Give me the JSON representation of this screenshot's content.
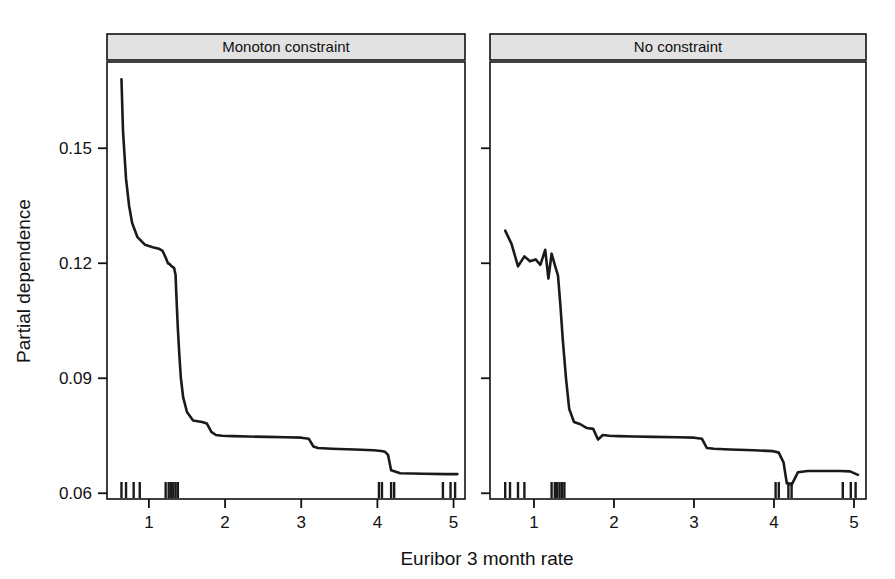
{
  "figure": {
    "xlabel": "Euribor 3 month rate",
    "ylabel": "Partial dependence",
    "line_color": "#1a1a1a",
    "strip_fill": "#e2e2e2",
    "strip_border": "#111111",
    "panel_border": "#111111"
  },
  "panels": [
    {
      "id": "monoton",
      "strip_label": "Monoton constraint"
    },
    {
      "id": "noconstraint",
      "strip_label": "No constraint"
    }
  ],
  "axes": {
    "x_ticks": [
      "1",
      "2",
      "3",
      "4",
      "5"
    ],
    "x_tick_values": [
      1,
      2,
      3,
      4,
      5
    ],
    "y_ticks": [
      "0.06",
      "0.09",
      "0.12",
      "0.15"
    ],
    "y_tick_values": [
      0.06,
      0.09,
      0.12,
      0.15
    ],
    "xlim": [
      0.45,
      5.15
    ],
    "ylim": [
      0.0585,
      0.1725
    ]
  },
  "chart_data": {
    "type": "line",
    "title": "",
    "xlabel": "Euribor 3 month rate",
    "ylabel": "Partial dependence",
    "xlim": [
      0.45,
      5.15
    ],
    "ylim": [
      0.0585,
      0.1725
    ],
    "grid": false,
    "legend": "none",
    "facets": [
      "Monoton constraint",
      "No constraint"
    ],
    "series": [
      {
        "name": "Monoton constraint",
        "facet": "Monoton constraint",
        "x": [
          0.64,
          0.66,
          0.7,
          0.74,
          0.78,
          0.85,
          0.95,
          1.05,
          1.13,
          1.18,
          1.22,
          1.25,
          1.27,
          1.3,
          1.33,
          1.35,
          1.36,
          1.38,
          1.4,
          1.42,
          1.45,
          1.5,
          1.58,
          1.64,
          1.7,
          1.76,
          1.82,
          1.88,
          1.96,
          2.1,
          2.3,
          2.55,
          2.8,
          3.0,
          3.1,
          3.16,
          3.22,
          3.4,
          3.7,
          3.95,
          4.05,
          4.1,
          4.14,
          4.18,
          4.3,
          4.6,
          4.9,
          5.05
        ],
        "y": [
          0.168,
          0.1545,
          0.142,
          0.135,
          0.1305,
          0.1268,
          0.1248,
          0.1242,
          0.1238,
          0.1232,
          0.1215,
          0.12,
          0.1198,
          0.1192,
          0.1188,
          0.117,
          0.112,
          0.103,
          0.096,
          0.09,
          0.085,
          0.0812,
          0.079,
          0.0788,
          0.0786,
          0.0782,
          0.076,
          0.0752,
          0.075,
          0.0749,
          0.0748,
          0.0747,
          0.0746,
          0.0745,
          0.0742,
          0.0722,
          0.0718,
          0.0716,
          0.0714,
          0.0712,
          0.071,
          0.0708,
          0.07,
          0.066,
          0.0652,
          0.0651,
          0.065,
          0.065
        ]
      },
      {
        "name": "No constraint",
        "facet": "No constraint",
        "x": [
          0.64,
          0.72,
          0.8,
          0.88,
          0.95,
          1.02,
          1.08,
          1.14,
          1.18,
          1.22,
          1.26,
          1.3,
          1.33,
          1.36,
          1.4,
          1.44,
          1.5,
          1.58,
          1.66,
          1.74,
          1.8,
          1.86,
          1.94,
          2.05,
          2.25,
          2.5,
          2.8,
          3.0,
          3.1,
          3.16,
          3.25,
          3.45,
          3.75,
          3.98,
          4.06,
          4.12,
          4.16,
          4.22,
          4.3,
          4.42,
          4.6,
          4.82,
          4.95,
          5.05
        ],
        "y": [
          0.1285,
          0.125,
          0.1192,
          0.1218,
          0.1205,
          0.121,
          0.1196,
          0.1235,
          0.116,
          0.1225,
          0.1196,
          0.1168,
          0.109,
          0.1,
          0.09,
          0.082,
          0.0786,
          0.078,
          0.077,
          0.0768,
          0.074,
          0.0752,
          0.075,
          0.0749,
          0.0748,
          0.0747,
          0.0746,
          0.0745,
          0.0742,
          0.0718,
          0.0716,
          0.0714,
          0.0712,
          0.071,
          0.0706,
          0.068,
          0.0626,
          0.0622,
          0.0655,
          0.0658,
          0.0658,
          0.0658,
          0.0657,
          0.0648
        ]
      }
    ],
    "rug_marks": {
      "Monoton constraint": [
        0.64,
        0.7,
        0.8,
        0.88,
        1.22,
        1.26,
        1.29,
        1.32,
        1.35,
        1.38,
        4.02,
        4.06,
        4.18,
        4.22,
        4.86,
        4.96,
        5.02
      ],
      "No constraint": [
        0.64,
        0.7,
        0.8,
        0.88,
        1.22,
        1.26,
        1.29,
        1.32,
        1.35,
        1.38,
        4.02,
        4.06,
        4.18,
        4.22,
        4.86,
        4.96,
        5.02
      ]
    }
  }
}
